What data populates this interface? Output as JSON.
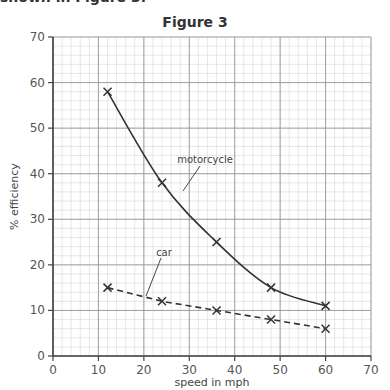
{
  "header": {
    "cut_text": "shown in Figure 3.",
    "title": "Figure 3"
  },
  "chart_data": {
    "type": "line",
    "title": "Figure 3",
    "xlabel": "speed in mph",
    "ylabel": "% efficiency",
    "xlim": [
      0,
      70
    ],
    "ylim": [
      0,
      70
    ],
    "xticks": [
      0,
      10,
      20,
      30,
      40,
      50,
      60,
      70
    ],
    "yticks": [
      0,
      10,
      20,
      30,
      40,
      50,
      60,
      70
    ],
    "grid": {
      "major": 10,
      "minor": 2
    },
    "series": [
      {
        "name": "motorcycle",
        "style": "solid",
        "marker": "x",
        "x": [
          12,
          24,
          36,
          48,
          60
        ],
        "y": [
          58,
          38,
          25,
          15,
          11
        ]
      },
      {
        "name": "car",
        "style": "dashed",
        "marker": "x",
        "x": [
          12,
          24,
          36,
          48,
          60
        ],
        "y": [
          15,
          12,
          10,
          8,
          6
        ]
      }
    ],
    "annotations": [
      {
        "text": "motorcycle",
        "x": 31,
        "y": 43
      },
      {
        "text": "car",
        "x": 24.5,
        "y": 22.5
      }
    ]
  },
  "colors": {
    "line": "#333333",
    "major_grid": "#999999",
    "minor_grid": "#dddddd",
    "axis": "#444444"
  }
}
